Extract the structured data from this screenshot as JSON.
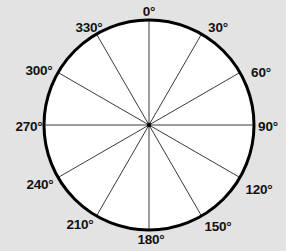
{
  "figure": {
    "name": "compass-rose-polar-diagram",
    "background_color": "#e3e3e3",
    "circle_fill": "#ffffff",
    "circle_stroke": "#000000",
    "spoke_stroke": "#3a3a3a",
    "center_x": 149,
    "center_y": 125,
    "radius": 105,
    "outline_width": 3,
    "spoke_width": 1
  },
  "chart_data": {
    "type": "polar",
    "title": "",
    "grid": false,
    "spoke_interval_deg": 30,
    "direction": "clockwise",
    "zero_at": "top",
    "angles": [
      0,
      30,
      60,
      90,
      120,
      150,
      180,
      210,
      240,
      270,
      300,
      330
    ]
  },
  "labels": [
    {
      "id": "label-0",
      "text": "0°",
      "angle": 0,
      "x": 149,
      "y": 12,
      "anchor": "center"
    },
    {
      "id": "label-30",
      "text": "30°",
      "angle": 30,
      "x": 218,
      "y": 28,
      "anchor": "center"
    },
    {
      "id": "label-60",
      "text": "60°",
      "angle": 60,
      "x": 261,
      "y": 73,
      "anchor": "center"
    },
    {
      "id": "label-90",
      "text": "90°",
      "angle": 90,
      "x": 268,
      "y": 127,
      "anchor": "center"
    },
    {
      "id": "label-120",
      "text": "120°",
      "angle": 120,
      "x": 259,
      "y": 190,
      "anchor": "center"
    },
    {
      "id": "label-150",
      "text": "150°",
      "angle": 150,
      "x": 218,
      "y": 227,
      "anchor": "center"
    },
    {
      "id": "label-180",
      "text": "180°",
      "angle": 180,
      "x": 151,
      "y": 240,
      "anchor": "center"
    },
    {
      "id": "label-210",
      "text": "210°",
      "angle": 210,
      "x": 80,
      "y": 225,
      "anchor": "center"
    },
    {
      "id": "label-240",
      "text": "240°",
      "angle": 240,
      "x": 40,
      "y": 185,
      "anchor": "center"
    },
    {
      "id": "label-270",
      "text": "270°",
      "angle": 270,
      "x": 29,
      "y": 127,
      "anchor": "center"
    },
    {
      "id": "label-300",
      "text": "300°",
      "angle": 300,
      "x": 39,
      "y": 71,
      "anchor": "center"
    },
    {
      "id": "label-330",
      "text": "330°",
      "angle": 330,
      "x": 89,
      "y": 28,
      "anchor": "center"
    }
  ]
}
